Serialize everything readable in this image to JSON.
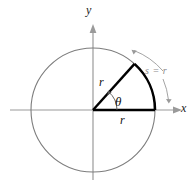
{
  "figure": {
    "type": "geometry-diagram",
    "background_color": "#ffffff"
  },
  "axes": {
    "x_label": "x",
    "y_label": "y",
    "color": "#9a9a9a",
    "arrowheads": [
      "x-positive",
      "y-positive"
    ]
  },
  "circle": {
    "center": {
      "x": 93,
      "y": 110
    },
    "radius": 62,
    "stroke_color": "#7d7d7d"
  },
  "sector": {
    "stroke_color": "#000000",
    "radius_labels": {
      "slant": "r",
      "base": "r"
    },
    "angle_label": "θ",
    "arc_label": "s = r",
    "arc_label_color": "#8a8a8a",
    "start_angle_deg": 0,
    "end_angle_deg": 48
  },
  "annotations": {
    "arc_measure_arrow_color": "#9a9a9a",
    "angle_arrow_color": "#555555"
  }
}
